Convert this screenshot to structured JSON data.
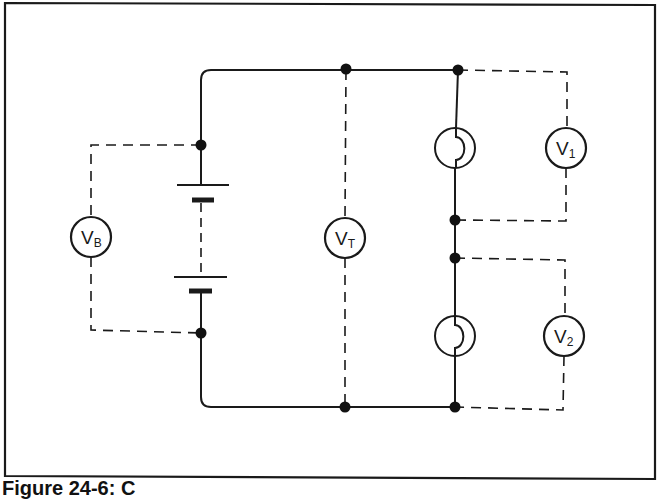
{
  "figure": {
    "caption": "Figure 24-6: C",
    "frame": {
      "left": 5,
      "top": 3,
      "right": 655,
      "bottom": 478
    },
    "colors": {
      "ink": "#1a1a1a",
      "background": "#ffffff"
    }
  },
  "circuit": {
    "type": "series circuit with battery and two lamps, voltmeter measurement points",
    "battery": {
      "cells": 2,
      "label": "battery"
    },
    "lamps": [
      {
        "id": "lamp-1",
        "label": "lamp 1"
      },
      {
        "id": "lamp-2",
        "label": "lamp 2"
      }
    ],
    "voltmeters": [
      {
        "id": "vb",
        "main": "V",
        "sub": "B",
        "measures": "battery voltage"
      },
      {
        "id": "vt",
        "main": "V",
        "sub": "T",
        "measures": "total voltage"
      },
      {
        "id": "v1",
        "main": "V",
        "sub": "1",
        "measures": "lamp 1 voltage"
      },
      {
        "id": "v2",
        "main": "V",
        "sub": "2",
        "measures": "lamp 2 voltage"
      }
    ]
  }
}
